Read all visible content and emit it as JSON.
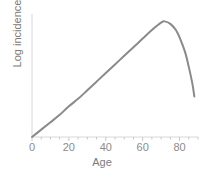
{
  "chart_data": {
    "type": "line",
    "title": "",
    "xlabel": "Age",
    "ylabel": "Log incidence",
    "xlim": [
      0,
      90
    ],
    "ylim": [
      0,
      100
    ],
    "xticks": [
      0,
      20,
      40,
      60,
      80
    ],
    "xticklabels": [
      "0",
      "20",
      "40",
      "60",
      "80"
    ],
    "minor_tick_interval": 5,
    "yticks": [],
    "yticklabels": [],
    "grid": false,
    "legend": false,
    "series": [
      {
        "name": "Log incidence by age",
        "color": "#8a8a8a",
        "linewidth": 2,
        "x": [
          0,
          5,
          10,
          15,
          20,
          25,
          30,
          35,
          40,
          45,
          50,
          55,
          60,
          65,
          70,
          72,
          75,
          78,
          80,
          83,
          85,
          87,
          88
        ],
        "y": [
          0,
          6,
          12,
          18,
          25,
          31,
          38,
          45,
          52,
          59,
          66,
          73,
          80,
          87,
          93,
          94,
          92,
          87,
          81,
          69,
          57,
          43,
          33
        ]
      }
    ]
  },
  "axis": {
    "axis_color": "#d8d8d8",
    "tick_color": "#c8c8c8",
    "tick_label_color": "#8c8c8c",
    "axis_label_color": "#7a7a7a",
    "background": "#ffffff"
  }
}
